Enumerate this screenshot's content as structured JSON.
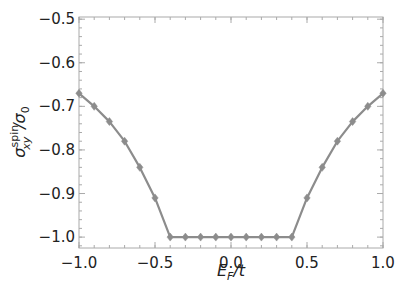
{
  "chart_data": {
    "type": "line",
    "title": "",
    "xlabel": "E_F/t",
    "ylabel": "σ_xy^spin/σ_0",
    "xlim": [
      -1.0,
      1.0
    ],
    "ylim": [
      -1.025,
      -0.495
    ],
    "grid": false,
    "legend": null,
    "xticks": [
      -1.0,
      -0.5,
      0.0,
      0.5,
      1.0
    ],
    "xtick_labels": [
      "−1.0",
      "−0.5",
      "0.0",
      "0.5",
      "1.0"
    ],
    "yticks": [
      -0.5,
      -0.6,
      -0.7,
      -0.8,
      -0.9,
      -1.0
    ],
    "ytick_labels": [
      "−0.5",
      "−0.6",
      "−0.7",
      "−0.8",
      "−0.9",
      "−1.0"
    ],
    "series": [
      {
        "name": "spin Hall conductivity",
        "color": "#8c8c8c",
        "marker": "diamond",
        "x": [
          -1.0,
          -0.9,
          -0.8,
          -0.7,
          -0.6,
          -0.5,
          -0.4,
          -0.3,
          -0.2,
          -0.1,
          0.0,
          0.1,
          0.2,
          0.3,
          0.4,
          0.5,
          0.6,
          0.7,
          0.8,
          0.9,
          1.0
        ],
        "values": [
          -0.67,
          -0.7,
          -0.735,
          -0.78,
          -0.84,
          -0.91,
          -1.0,
          -1.0,
          -1.0,
          -1.0,
          -1.0,
          -1.0,
          -1.0,
          -1.0,
          -1.0,
          -0.91,
          -0.84,
          -0.78,
          -0.735,
          -0.7,
          -0.67
        ]
      }
    ]
  },
  "labels": {
    "xlabel_main": "E",
    "xlabel_sub": "F",
    "xlabel_rest": "/t",
    "ylabel_main": "σ",
    "ylabel_sup": "spin",
    "ylabel_sub": "xy",
    "ylabel_rest": "/σ",
    "ylabel_rest_sub": "0"
  }
}
